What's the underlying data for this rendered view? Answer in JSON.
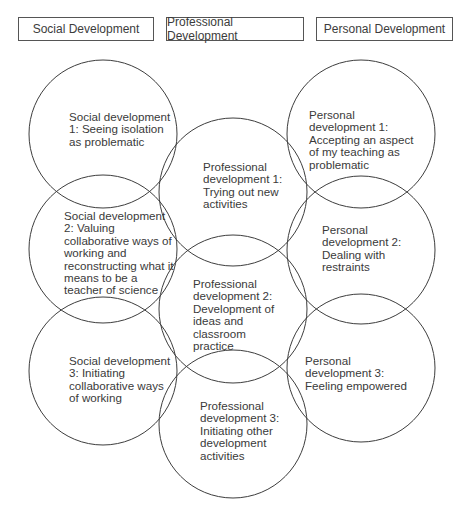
{
  "headers": [
    {
      "label": "Social Development"
    },
    {
      "label": "Professional Development"
    },
    {
      "label": "Personal Development"
    }
  ],
  "stroke_color": "#3d3d3d",
  "circles": {
    "social": [
      {
        "label": "Social development 1: Seeing isolation as problematic"
      },
      {
        "label": "Social development 2: Valuing collaborative ways of working and reconstructing what it means to be a teacher of science"
      },
      {
        "label": "Social development 3: Initiating collaborative ways of working"
      }
    ],
    "professional": [
      {
        "label": "Professional development 1: Trying out new activities"
      },
      {
        "label": "Professional development 2: Development of ideas and classroom practice"
      },
      {
        "label": "Professional development 3: Initiating other development activities"
      }
    ],
    "personal": [
      {
        "label": "Personal development 1: Accepting an aspect of my teaching as problematic"
      },
      {
        "label": "Personal development 2: Dealing with restraints"
      },
      {
        "label": "Personal development 3: Feeling empowered"
      }
    ]
  }
}
